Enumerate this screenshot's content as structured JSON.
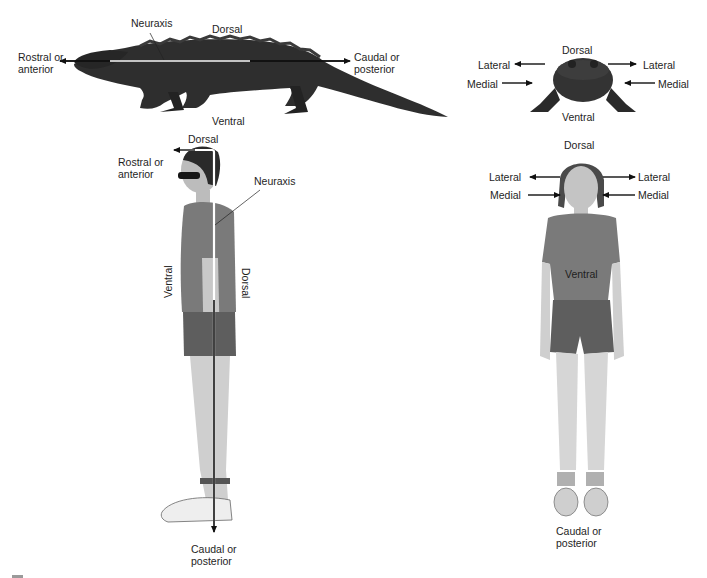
{
  "figure": {
    "panels": [
      {
        "id": "alligator-side",
        "subject": "alligator (lateral view)",
        "labels": {
          "neuraxis": "Neuraxis",
          "dorsal": "Dorsal",
          "ventral": "Ventral",
          "rostral_line1": "Rostral or",
          "rostral_line2": "anterior",
          "caudal_line1": "Caudal or",
          "caudal_line2": "posterior"
        }
      },
      {
        "id": "alligator-front",
        "subject": "alligator (frontal view)",
        "labels": {
          "dorsal": "Dorsal",
          "ventral": "Ventral",
          "lateral_left": "Lateral",
          "lateral_right": "Lateral",
          "medial_left": "Medial",
          "medial_right": "Medial"
        }
      },
      {
        "id": "human-side",
        "subject": "human (lateral view)",
        "labels": {
          "dorsal_top": "Dorsal",
          "rostral_line1": "Rostral or",
          "rostral_line2": "anterior",
          "neuraxis": "Neuraxis",
          "ventral_side": "Ventral",
          "dorsal_side": "Dorsal",
          "caudal_line1": "Caudal or",
          "caudal_line2": "posterior"
        }
      },
      {
        "id": "human-front",
        "subject": "human (frontal view)",
        "labels": {
          "dorsal": "Dorsal",
          "lateral_left": "Lateral",
          "lateral_right": "Lateral",
          "medial_left": "Medial",
          "medial_right": "Medial",
          "ventral": "Ventral",
          "caudal_line1": "Caudal or",
          "caudal_line2": "posterior"
        }
      }
    ],
    "colors": {
      "background": "#ffffff",
      "arrow": "#111111",
      "neuraxis_line": "#ffffff",
      "alligator": "#2e2e2e",
      "skin": "#c9c9c9",
      "shirt": "#7a7a7a",
      "shorts": "#5e5e5e",
      "hair": "#2a2a2a"
    }
  }
}
